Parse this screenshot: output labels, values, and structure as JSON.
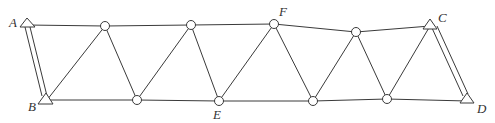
{
  "diagram": {
    "type": "truss",
    "labels": {
      "A": "A",
      "B": "B",
      "C": "C",
      "D": "D",
      "E": "E",
      "F": "F"
    },
    "colors": {
      "stroke": "#3a3a3a",
      "background": "#ffffff"
    }
  }
}
